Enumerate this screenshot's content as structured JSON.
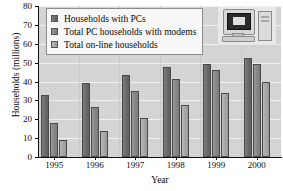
{
  "chart_data": {
    "type": "bar",
    "title": "",
    "xlabel": "Year",
    "ylabel": "Households (millions)",
    "categories": [
      "1995",
      "1996",
      "1997",
      "1998",
      "1999",
      "2000"
    ],
    "ylim": [
      0,
      80
    ],
    "yticks": [
      0,
      10,
      20,
      30,
      40,
      50,
      60,
      70,
      80
    ],
    "grid": true,
    "legend_position": "top-left",
    "series": [
      {
        "name": "Households with PCs",
        "color": "#6e6e6e",
        "values": [
          33,
          39,
          43.5,
          47.5,
          49.5,
          52.5
        ]
      },
      {
        "name": "Total PC households with modems",
        "color": "#8a8a8a",
        "values": [
          18,
          26.5,
          35,
          41.5,
          46,
          49.5
        ]
      },
      {
        "name": "Total on-line households",
        "color": "#a9a9a9",
        "values": [
          9,
          14,
          20.5,
          27.5,
          34,
          40
        ]
      }
    ]
  },
  "clipart": {
    "name": "desktop-computer-illustration"
  }
}
